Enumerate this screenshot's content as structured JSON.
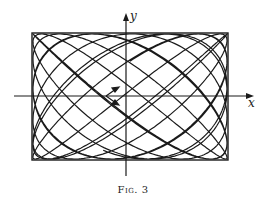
{
  "figure": {
    "caption": "Fig. 3",
    "x_axis_label": "x",
    "y_axis_label": "y",
    "ink_color": "#1a1a1a",
    "background": "#ffffff"
  },
  "chart_data": {
    "type": "line",
    "title": "Fig. 3",
    "xlabel": "x",
    "ylabel": "y",
    "bounding_box": {
      "x_min": -1,
      "x_max": 1,
      "y_min": -1,
      "y_max": 1
    },
    "curve": {
      "x": "sin(a t)",
      "y": "sin(b t + phase)",
      "a": 1,
      "b": 1.23,
      "phase": 0.6,
      "t_max": 60
    },
    "grid": false,
    "legend": null
  }
}
